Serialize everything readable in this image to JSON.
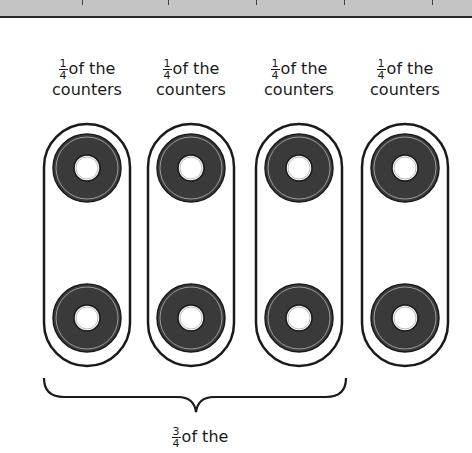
{
  "groups": [
    {
      "fraction_num": "1",
      "fraction_den": "4",
      "text": "of the",
      "text2": "counters",
      "counters": 2
    },
    {
      "fraction_num": "1",
      "fraction_den": "4",
      "text": "of the",
      "text2": "counters",
      "counters": 2
    },
    {
      "fraction_num": "1",
      "fraction_den": "4",
      "text": "of the",
      "text2": "counters",
      "counters": 2
    },
    {
      "fraction_num": "1",
      "fraction_den": "4",
      "text": "of the",
      "text2": "counters",
      "counters": 2
    }
  ],
  "brace_label": {
    "fraction_num": "3",
    "fraction_den": "4",
    "text": "of the"
  },
  "colors": {
    "counter": "#3a3a3a",
    "outline": "#1a1a1a",
    "band": "#c4c4c4"
  }
}
